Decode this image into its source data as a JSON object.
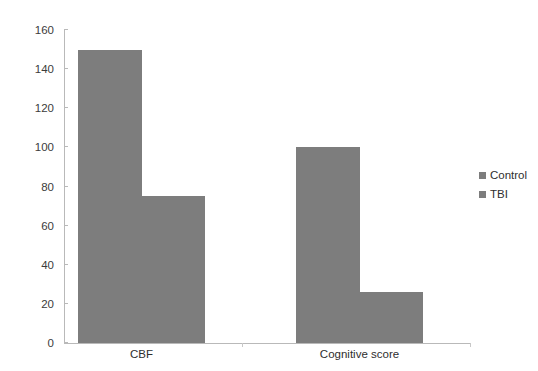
{
  "chart_data": {
    "type": "bar",
    "title": "",
    "subtitle": "",
    "xlabel": "",
    "ylabel": "",
    "categories": [
      "CBF",
      "Cognitive score"
    ],
    "series": [
      {
        "name": "Control",
        "values": [
          150,
          100
        ],
        "color": "#7d7d7d"
      },
      {
        "name": "TBI",
        "values": [
          75,
          26
        ],
        "color": "#7d7d7d"
      }
    ],
    "ylim": [
      0,
      160
    ],
    "ytick_step": 20,
    "yticks": [
      0,
      20,
      40,
      60,
      80,
      100,
      120,
      140,
      160
    ],
    "ytick_labels": [
      "0",
      "20",
      "40",
      "60",
      "80",
      "100",
      "120",
      "140",
      "160"
    ],
    "grid": false,
    "legend_position": "right",
    "legend": [
      {
        "label": "Control",
        "color": "#7d7d7d"
      },
      {
        "label": "TBI",
        "color": "#7d7d7d"
      }
    ],
    "bar_color": "#7d7d7d",
    "axis_color": "#b9b9b9",
    "text_color": "#2e2e2e",
    "background": "#ffffff"
  }
}
